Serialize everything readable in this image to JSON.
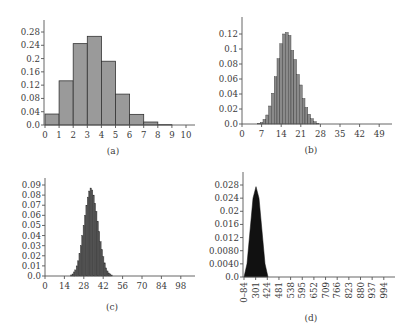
{
  "chart_data": [
    {
      "panel": "(a)",
      "type": "bar",
      "title": "",
      "xlabel": "",
      "ylabel": "",
      "categories": [
        0,
        1,
        2,
        3,
        4,
        5,
        6,
        7,
        8,
        9,
        10
      ],
      "values": [
        0.033,
        0.133,
        0.245,
        0.267,
        0.192,
        0.093,
        0.032,
        0.009,
        0.001,
        0.0,
        0.0
      ],
      "xticks": [
        "0",
        "1",
        "2",
        "3",
        "4",
        "5",
        "6",
        "7",
        "8",
        "9",
        "10"
      ],
      "yticks": [
        "0.0",
        "0.04",
        "0.08",
        "0.12",
        "0.16",
        "0.2",
        "0.24",
        "0.28"
      ],
      "ylim": [
        0,
        0.3
      ],
      "bar_color": "#9a9a9a",
      "grid": false
    },
    {
      "panel": "(b)",
      "type": "bar",
      "xlabel": "",
      "ylabel": "",
      "categories": [
        6,
        7,
        8,
        9,
        10,
        11,
        12,
        13,
        14,
        15,
        16,
        17,
        18,
        19,
        20,
        21,
        22,
        23,
        24,
        25,
        26,
        27
      ],
      "values": [
        0.001,
        0.002,
        0.006,
        0.012,
        0.024,
        0.041,
        0.063,
        0.087,
        0.107,
        0.12,
        0.122,
        0.118,
        0.098,
        0.086,
        0.066,
        0.052,
        0.034,
        0.022,
        0.013,
        0.007,
        0.003,
        0.001
      ],
      "xticks": [
        "0",
        "7",
        "14",
        "21",
        "28",
        "35",
        "42",
        "49"
      ],
      "yticks": [
        "0.0",
        "0.02",
        "0.04",
        "0.06",
        "0.08",
        "0.1",
        "0.12"
      ],
      "ylim": [
        0,
        0.14
      ],
      "bar_color": "#8a8a8a",
      "grid": false
    },
    {
      "panel": "(c)",
      "type": "bar",
      "xlabel": "",
      "ylabel": "",
      "categories": [
        19,
        20,
        21,
        22,
        23,
        24,
        25,
        26,
        27,
        28,
        29,
        30,
        31,
        32,
        33,
        34,
        35,
        36,
        37,
        38,
        39,
        40,
        41,
        42,
        43,
        44,
        45,
        46,
        47,
        48
      ],
      "values": [
        0.001,
        0.002,
        0.004,
        0.006,
        0.01,
        0.015,
        0.022,
        0.03,
        0.04,
        0.05,
        0.06,
        0.07,
        0.078,
        0.084,
        0.087,
        0.085,
        0.08,
        0.072,
        0.064,
        0.054,
        0.044,
        0.034,
        0.026,
        0.019,
        0.013,
        0.008,
        0.005,
        0.003,
        0.002,
        0.001
      ],
      "xticks": [
        "0",
        "14",
        "28",
        "42",
        "56",
        "70",
        "84",
        "98"
      ],
      "yticks": [
        "0.0",
        "0.01",
        "0.02",
        "0.03",
        "0.04",
        "0.05",
        "0.06",
        "0.07",
        "0.08",
        "0.09"
      ],
      "ylim": [
        0,
        0.095
      ],
      "bar_color": "#555555",
      "grid": false
    },
    {
      "panel": "(d)",
      "type": "area",
      "xlabel": "",
      "ylabel": "",
      "x": [
        244,
        247,
        250,
        253,
        256,
        259,
        262,
        265,
        268
      ],
      "values": [
        0.0,
        0.004,
        0.014,
        0.024,
        0.0275,
        0.024,
        0.014,
        0.004,
        0.0
      ],
      "distribution_center": 300,
      "peak": 0.0275,
      "xticks": [
        "0–84",
        "301",
        "424",
        "481",
        "538",
        "595",
        "652",
        "709",
        "766",
        "823",
        "880",
        "937",
        "994"
      ],
      "yticks": [
        "0.0",
        "0.0040",
        "0.0080",
        "0.012",
        "0.016",
        "0.02",
        "0.024",
        "0.028"
      ],
      "ylim": [
        0,
        0.031
      ],
      "fill_color": "#111111",
      "grid": false
    }
  ],
  "labels": {
    "a": "(a)",
    "b": "(b)",
    "c": "(c)",
    "d": "(d)"
  }
}
